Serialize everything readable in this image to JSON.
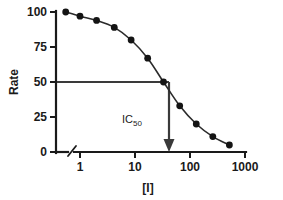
{
  "chart_data": {
    "type": "line",
    "title": "",
    "subtitle": "",
    "xlabel": "[I]",
    "ylabel": "Rate",
    "xscale": "log",
    "yscale": "linear",
    "xlim": [
      0.6,
      1000
    ],
    "ylim": [
      0,
      100
    ],
    "grid": false,
    "legend": null,
    "axis_break": {
      "axis": "x",
      "note": "break between origin and first decade"
    },
    "x_ticks": [
      1,
      10,
      100,
      1000
    ],
    "x_tick_labels": [
      "1",
      "10",
      "100",
      "1000"
    ],
    "y_ticks": [
      0,
      25,
      50,
      75,
      100
    ],
    "y_tick_labels": [
      "0",
      "25",
      "50",
      "75",
      "100"
    ],
    "series": [
      {
        "name": "Rate vs [I]",
        "marker": "filled-circle",
        "x": [
          0.55,
          1,
          2,
          4.2,
          8.5,
          17,
          33,
          65,
          130,
          260,
          520
        ],
        "y": [
          100,
          97,
          94,
          89,
          80,
          67,
          50,
          33,
          20,
          11,
          5
        ]
      }
    ],
    "annotations": [
      {
        "name": "ic50-guide",
        "label": "IC50",
        "label_base": "IC",
        "label_sub": "50",
        "rate_level": 50,
        "concentration": 33,
        "description": "Horizontal line at Rate = 50 meeting the curve, with a vertical arrow down to the [I] axis"
      }
    ]
  },
  "axes": {
    "y_title": "Rate",
    "x_title": "[I]"
  },
  "colors": {
    "axis": "#1a1a1a",
    "curve": "#2b2b2b",
    "marker": "#141414",
    "guide": "#3a3a3a",
    "background": "#ffffff"
  }
}
